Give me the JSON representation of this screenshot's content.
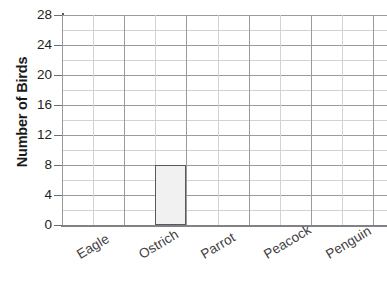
{
  "chart_data": {
    "type": "bar",
    "title": "",
    "xlabel": "",
    "ylabel": "Number of Birds",
    "categories": [
      "Eagle",
      "Ostrich",
      "Parrot",
      "Peacock",
      "Penguin"
    ],
    "values": [
      0,
      8,
      0,
      0,
      0
    ],
    "ylim": [
      0,
      28
    ],
    "ytick_step": 4,
    "yticks": [
      28,
      24,
      20,
      16,
      12,
      8,
      4,
      0
    ],
    "ytick_labels": [
      "28",
      "24",
      "20",
      "16",
      "12",
      "8",
      "4",
      "0"
    ],
    "grid": true,
    "minor_grid": true,
    "legend": false,
    "legend_position": "none",
    "bar_fill_color": "#f1f1f1",
    "bar_border_color": "#58595b",
    "grid_color": "#9a9a9a",
    "minor_grid_color": "#d3d3d3",
    "axis_color": "#58595b",
    "label_color": "#414042",
    "tick_label_color": "#231f20",
    "background_color": "#ffffff",
    "x_label_rotation": -31
  }
}
